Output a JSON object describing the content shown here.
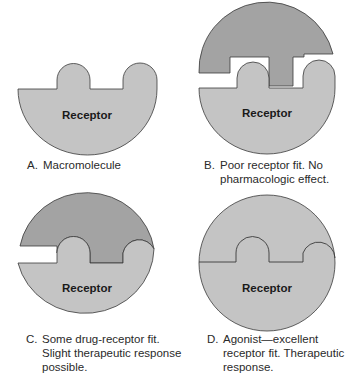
{
  "colors": {
    "receptor_fill": "#c4c4c4",
    "drug_fill": "#a3a3a3",
    "outline": "#3a3a3a",
    "background": "#ffffff"
  },
  "panels": [
    {
      "id": "A",
      "receptor_label": "Receptor",
      "caption_letter": "A.",
      "caption_lines": [
        "Macromolecule"
      ]
    },
    {
      "id": "B",
      "receptor_label": "Receptor",
      "caption_letter": "B.",
      "caption_lines": [
        "Poor receptor fit. No",
        "pharmacologic effect."
      ]
    },
    {
      "id": "C",
      "receptor_label": "Receptor",
      "caption_letter": "C.",
      "caption_lines": [
        "Some drug-receptor fit.",
        "Slight therapeutic response",
        "possible."
      ]
    },
    {
      "id": "D",
      "receptor_label": "Receptor",
      "caption_letter": "D.",
      "caption_lines": [
        "Agonist—excellent",
        "receptor fit. Therapeutic",
        "response."
      ]
    }
  ]
}
